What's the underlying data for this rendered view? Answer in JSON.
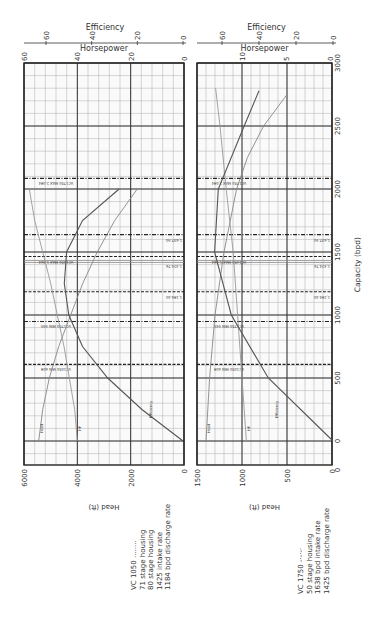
{
  "chart_data": [
    {
      "type": "line",
      "title": "VC 1050 pump curve",
      "orientation": "rotated 90 degrees clockwise",
      "xlabel": "Capacity (bpd)",
      "x_ticks": [
        0,
        500,
        1000,
        1500,
        2000,
        2500,
        3000
      ],
      "xlim": [
        0,
        3000
      ],
      "axes": {
        "head": {
          "label": "Head (ft)",
          "ticks": [
            0,
            2000,
            4000,
            6000
          ],
          "range": [
            0,
            6000
          ]
        },
        "horsepower": {
          "label": "Horsepower",
          "ticks": [
            0,
            20,
            40,
            60
          ],
          "range": [
            0,
            60
          ]
        },
        "efficiency": {
          "label": "Efficiency",
          "ticks": [
            0,
            20,
            40,
            60
          ],
          "range": [
            0,
            60
          ]
        }
      },
      "series": [
        {
          "name": "Head",
          "axis": "head",
          "x": [
            0,
            250,
            500,
            750,
            1000,
            1250,
            1500,
            1750,
            2000
          ],
          "values": [
            5450,
            5300,
            5050,
            4700,
            4250,
            3800,
            3250,
            2600,
            1750
          ]
        },
        {
          "name": "HP",
          "axis": "horsepower",
          "x": [
            0,
            250,
            500,
            750,
            1000,
            1250,
            1500,
            1750,
            2000
          ],
          "values": [
            40,
            41,
            43,
            45,
            47.5,
            50,
            53,
            56,
            58
          ]
        },
        {
          "name": "Efficiency",
          "axis": "efficiency",
          "x": [
            0,
            250,
            500,
            750,
            1000,
            1250,
            1500,
            1750,
            2000
          ],
          "values": [
            0,
            18,
            33,
            44,
            50,
            52,
            51,
            44,
            28
          ]
        }
      ],
      "reference_lines": [
        {
          "label": "VC1050 MIN 608",
          "x": 608,
          "style": "dashed"
        },
        {
          "label": "VC1750 MIN 949",
          "x": 949,
          "style": "dash-dot"
        },
        {
          "label": "1,184.40",
          "x": 1184,
          "style": "dashed"
        },
        {
          "label": "1,424.76",
          "x": 1425,
          "style": "solid-double"
        },
        {
          "label": "VC1050 MAX 1,464",
          "x": 1464,
          "style": "dashed"
        },
        {
          "label": "1,637.90",
          "x": 1638,
          "style": "dash-dot"
        },
        {
          "label": "VC1750 MAX 2,084",
          "x": 2084,
          "style": "dash-dot"
        }
      ],
      "grid": true
    },
    {
      "type": "line",
      "title": "VC 1750 pump curve",
      "orientation": "rotated 90 degrees clockwise",
      "xlabel": "Capacity (bpd)",
      "x_ticks": [
        0,
        500,
        1000,
        1500,
        2000,
        2500,
        3000
      ],
      "xlim": [
        0,
        3000
      ],
      "axes": {
        "head": {
          "label": "Head (ft)",
          "ticks": [
            0,
            500,
            1000,
            1500
          ],
          "range": [
            0,
            1500
          ]
        },
        "horsepower": {
          "label": "Horsepower",
          "ticks": [
            0,
            5,
            10
          ],
          "range": [
            0,
            15
          ]
        },
        "efficiency": {
          "label": "Efficiency",
          "ticks": [
            0,
            20,
            40,
            60
          ],
          "range": [
            0,
            70
          ]
        }
      },
      "series": [
        {
          "name": "Head",
          "axis": "head",
          "x": [
            0,
            500,
            1000,
            1500,
            2000,
            2250,
            2500,
            2750
          ],
          "values": [
            1400,
            1360,
            1300,
            1200,
            1060,
            940,
            760,
            500
          ]
        },
        {
          "name": "HP",
          "axis": "horsepower",
          "x": [
            0,
            500,
            1000,
            1500,
            2000,
            2500,
            2800
          ],
          "values": [
            9.5,
            10,
            10.5,
            11,
            11.8,
            12.5,
            13
          ]
        },
        {
          "name": "Efficiency",
          "axis": "efficiency",
          "x": [
            0,
            500,
            1000,
            1500,
            2000,
            2500,
            2780
          ],
          "values": [
            0,
            35,
            55,
            64,
            62,
            48,
            40
          ]
        }
      ],
      "reference_lines": [
        {
          "label": "VC1050 MIN 608",
          "x": 608,
          "style": "dashed"
        },
        {
          "label": "VC1750 MIN 949",
          "x": 949,
          "style": "dash-dot"
        },
        {
          "label": "1,184.40",
          "x": 1184,
          "style": "dashed"
        },
        {
          "label": "1,424.76",
          "x": 1425,
          "style": "solid-double"
        },
        {
          "label": "VC1050 MAX 1,464",
          "x": 1464,
          "style": "dashed"
        },
        {
          "label": "1,637.90",
          "x": 1638,
          "style": "dash-dot"
        },
        {
          "label": "VC1750 MAX 2,084",
          "x": 2084,
          "style": "dash-dot"
        }
      ],
      "grid": true
    }
  ],
  "labels": {
    "efficiency": "Efficiency",
    "horsepower": "Horsepower",
    "head": "Head (ft)",
    "capacity": "Capacity (bpd)",
    "curve_head": "Head",
    "curve_hp": "HP",
    "curve_eff": "Efficiency"
  },
  "legend": {
    "vc1050": {
      "title": "VC 1050 ........",
      "lines": [
        "71 stage housing",
        "80 stage housing",
        "1425 intake rate",
        "1184 bpd discharge rate"
      ]
    },
    "vc1750": {
      "title": "VC 1750 -·-·-·",
      "lines": [
        "50 stage housing",
        "1638 bpd intake rate",
        "1425 bpd discharge rate"
      ]
    }
  }
}
